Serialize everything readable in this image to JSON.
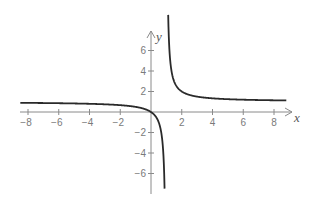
{
  "chart_data": {
    "type": "line",
    "title": "",
    "function": "y = x/(x-1)",
    "xlabel": "x",
    "ylabel": "y",
    "xlim": [
      -8.5,
      9
    ],
    "ylim": [
      -7.7,
      9.5
    ],
    "grid": false,
    "legend": null,
    "x_ticks": [
      -8,
      -6,
      -4,
      -2,
      2,
      4,
      6,
      8
    ],
    "x_tick_labels": [
      "−8",
      "−6",
      "−4",
      "−2",
      "2",
      "4",
      "6",
      "8"
    ],
    "y_ticks": [
      6,
      4,
      2,
      -2,
      -4,
      -6
    ],
    "y_tick_labels": [
      "6",
      "4",
      "2",
      "−2",
      "−4",
      "−6"
    ],
    "asymptotes": {
      "vertical": 1,
      "horizontal": 1
    },
    "series": [
      {
        "name": "left branch",
        "x": [
          -8.5,
          -8,
          -6,
          -4,
          -2,
          -1,
          0,
          0.5,
          0.7,
          0.85,
          0.88
        ],
        "y": [
          0.895,
          0.889,
          0.857,
          0.8,
          0.667,
          0.5,
          0,
          -1,
          -2.333,
          -5.667,
          -7.333
        ]
      },
      {
        "name": "right branch",
        "x": [
          1.1,
          1.2,
          1.5,
          2,
          3,
          4,
          6,
          8,
          8.8
        ],
        "y": [
          11,
          6,
          3,
          2,
          1.5,
          1.333,
          1.2,
          1.143,
          1.128
        ]
      }
    ]
  },
  "labels": {
    "x_axis": "x",
    "y_axis": "y"
  }
}
